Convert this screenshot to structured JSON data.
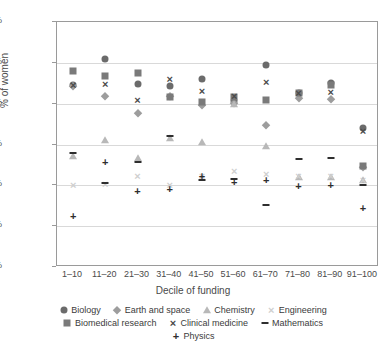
{
  "chart_data": {
    "type": "scatter",
    "title": "",
    "xlabel": "Decile of funding",
    "ylabel": "% of women",
    "ylim": [
      10,
      40
    ],
    "ytick_labels": [
      "40%",
      "35%",
      "30%",
      "25%",
      "20%",
      "15%",
      "10%"
    ],
    "yticks": [
      40,
      35,
      30,
      25,
      20,
      15,
      10
    ],
    "grid": true,
    "legend_position": "bottom",
    "categories": [
      "1–10",
      "11–20",
      "21–30",
      "31–40",
      "41–50",
      "51–60",
      "61–70",
      "71–80",
      "81–90",
      "91–100"
    ],
    "series": [
      {
        "name": "Biology",
        "marker": "circle",
        "color": "#6b6b6b",
        "values": [
          32.3,
          35.5,
          32.4,
          32.2,
          33.0,
          30.3,
          34.7,
          31.3,
          32.5,
          27.0
        ]
      },
      {
        "name": "Earth and space",
        "marker": "diamond",
        "color": "#9d9d9d",
        "values": [
          32.2,
          31.0,
          28.8,
          30.9,
          29.8,
          30.1,
          27.4,
          30.7,
          30.6,
          22.3
        ]
      },
      {
        "name": "Chemistry",
        "marker": "triangle",
        "color": "#b8b8b8",
        "values": [
          23.6,
          25.6,
          23.3,
          25.8,
          25.3,
          30.0,
          24.8,
          21.0,
          21.0,
          20.6
        ]
      },
      {
        "name": "Engineering",
        "marker": "x-light",
        "color": "#cfcfcf",
        "values": [
          20.0,
          20.2,
          21.2,
          20.0,
          21.2,
          21.8,
          21.4,
          21.2,
          21.2,
          20.6
        ]
      },
      {
        "name": "Biomedical research",
        "marker": "square",
        "color": "#7a7a7a",
        "values": [
          34.0,
          33.4,
          33.8,
          30.8,
          30.2,
          30.8,
          30.4,
          31.3,
          32.3,
          22.4
        ]
      },
      {
        "name": "Clinical medicine",
        "marker": "x-dark",
        "color": "#4a4a4a",
        "values": [
          32.3,
          32.4,
          30.4,
          33.0,
          31.5,
          30.9,
          32.6,
          31.3,
          31.4,
          26.7
        ]
      },
      {
        "name": "Mathematics",
        "marker": "dash",
        "color": "#2e2e2e",
        "values": [
          23.9,
          20.3,
          22.9,
          26.1,
          20.7,
          20.8,
          17.6,
          23.2,
          23.4,
          20.1
        ]
      },
      {
        "name": "Physics",
        "marker": "plus",
        "color": "#2e2e2e",
        "values": [
          16.2,
          22.8,
          19.3,
          19.6,
          21.2,
          20.4,
          20.7,
          19.9,
          20.0,
          17.2
        ]
      }
    ]
  }
}
